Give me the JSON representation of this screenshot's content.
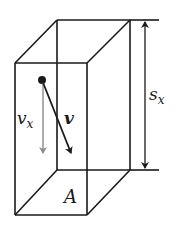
{
  "diagram": {
    "colors": {
      "line": "#1a1a1a",
      "component_arrow": "#8a8a8a",
      "background": "#ffffff"
    },
    "labels": {
      "velocity_component": "v",
      "velocity_component_sub": "x",
      "velocity": "v",
      "height": "s",
      "height_sub": "x",
      "area": "A"
    }
  }
}
